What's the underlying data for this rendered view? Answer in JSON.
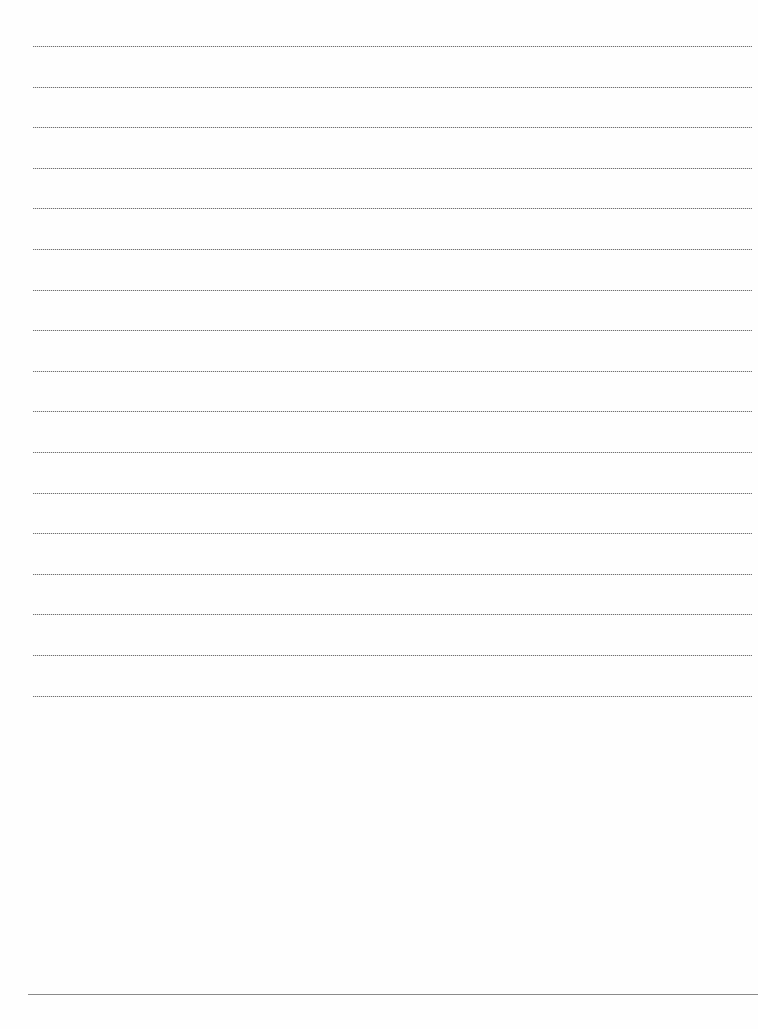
{
  "document": {
    "type": "blank lined paper",
    "ruled_line_count": 17,
    "ruled_line_style": "dotted",
    "ruled_line_color": "#6f6f6f",
    "footer_rule_color": "#8a8a8a",
    "background_color": "#fefefe",
    "text_content": []
  }
}
